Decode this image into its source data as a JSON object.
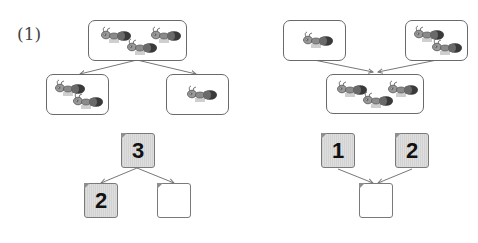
{
  "problem": {
    "label": "(1)"
  },
  "left_diagram": {
    "type": "decomposition",
    "picture_top": {
      "ant_count": 3
    },
    "picture_bottom_left": {
      "ant_count": 2
    },
    "picture_bottom_right": {
      "ant_count": 1
    },
    "number_top": {
      "value": "3",
      "filled": true
    },
    "number_bottom_left": {
      "value": "2",
      "filled": true
    },
    "number_bottom_right": {
      "value": "",
      "filled": false
    }
  },
  "right_diagram": {
    "type": "composition",
    "picture_top_left": {
      "ant_count": 1
    },
    "picture_top_right": {
      "ant_count": 2
    },
    "picture_bottom": {
      "ant_count": 3
    },
    "number_top_left": {
      "value": "1",
      "filled": true
    },
    "number_top_right": {
      "value": "2",
      "filled": true
    },
    "number_bottom": {
      "value": "",
      "filled": false
    }
  },
  "colors": {
    "box_border": "#6a6a6a",
    "filled_box": "#d8d8d8",
    "arrow": "#777777",
    "text": "#111111"
  }
}
